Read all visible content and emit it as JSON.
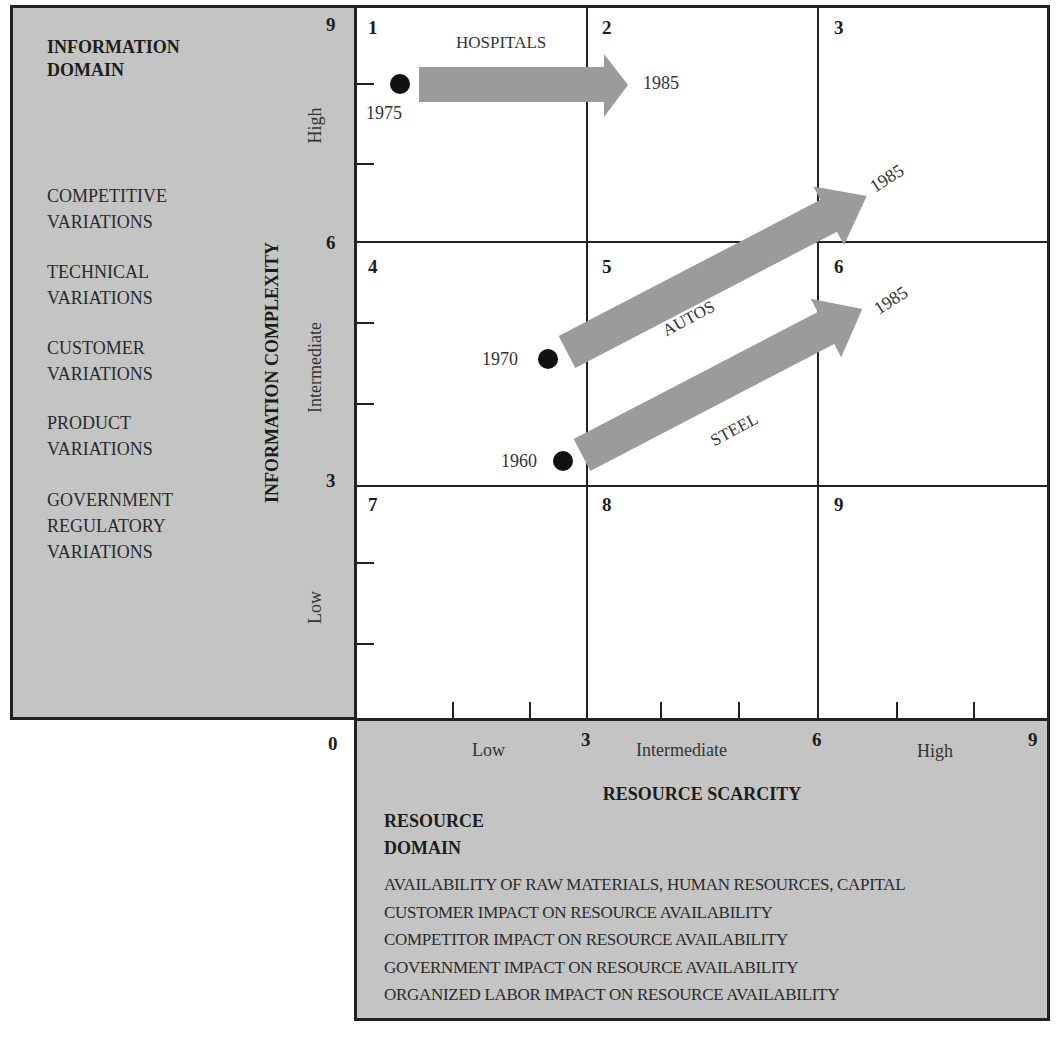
{
  "info_domain": {
    "title_line1": "INFORMATION",
    "title_line2": "DOMAIN",
    "items": [
      {
        "line1": "COMPETITIVE",
        "line2": "VARIATIONS"
      },
      {
        "line1": "TECHNICAL",
        "line2": "VARIATIONS"
      },
      {
        "line1": "CUSTOMER",
        "line2": "VARIATIONS"
      },
      {
        "line1": "PRODUCT",
        "line2": "VARIATIONS"
      },
      {
        "line1": "GOVERNMENT",
        "line2": "REGULATORY",
        "line3": "VARIATIONS"
      }
    ]
  },
  "y_axis": {
    "title": "INFORMATION COMPLEXITY",
    "ticks": [
      "0",
      "3",
      "6",
      "9"
    ],
    "levels": [
      "Low",
      "Intermediate",
      "High"
    ]
  },
  "x_axis": {
    "title": "RESOURCE SCARCITY",
    "ticks": [
      "0",
      "3",
      "6",
      "9"
    ],
    "levels": [
      "Low",
      "Intermediate",
      "High"
    ]
  },
  "cells": [
    "1",
    "2",
    "3",
    "4",
    "5",
    "6",
    "7",
    "8",
    "9"
  ],
  "resource_domain": {
    "title_line1": "RESOURCE",
    "title_line2": "DOMAIN",
    "items": [
      "AVAILABILITY OF RAW MATERIALS, HUMAN RESOURCES, CAPITAL",
      "CUSTOMER IMPACT ON RESOURCE AVAILABILITY",
      "COMPETITOR IMPACT ON RESOURCE AVAILABILITY",
      "GOVERNMENT IMPACT ON RESOURCE AVAILABILITY",
      "ORGANIZED LABOR IMPACT ON RESOURCE AVAILABILITY"
    ]
  },
  "trajectories": [
    {
      "industry": "HOSPITALS",
      "start_year": "1975",
      "end_year": "1985",
      "start": {
        "x": 0.6,
        "y": 7.9
      },
      "end": {
        "x": 3.5,
        "y": 7.9
      }
    },
    {
      "industry": "AUTOS",
      "start_year": "1970",
      "end_year": "1985",
      "start": {
        "x": 2.5,
        "y": 4.6
      },
      "end": {
        "x": 6.5,
        "y": 6.8
      }
    },
    {
      "industry": "STEEL",
      "start_year": "1960",
      "end_year": "1985",
      "start": {
        "x": 2.7,
        "y": 3.3
      },
      "end": {
        "x": 6.5,
        "y": 5.4
      }
    }
  ],
  "colors": {
    "panel": "#c4c4c4",
    "arrow": "#9b9b9b",
    "line": "#222222"
  }
}
